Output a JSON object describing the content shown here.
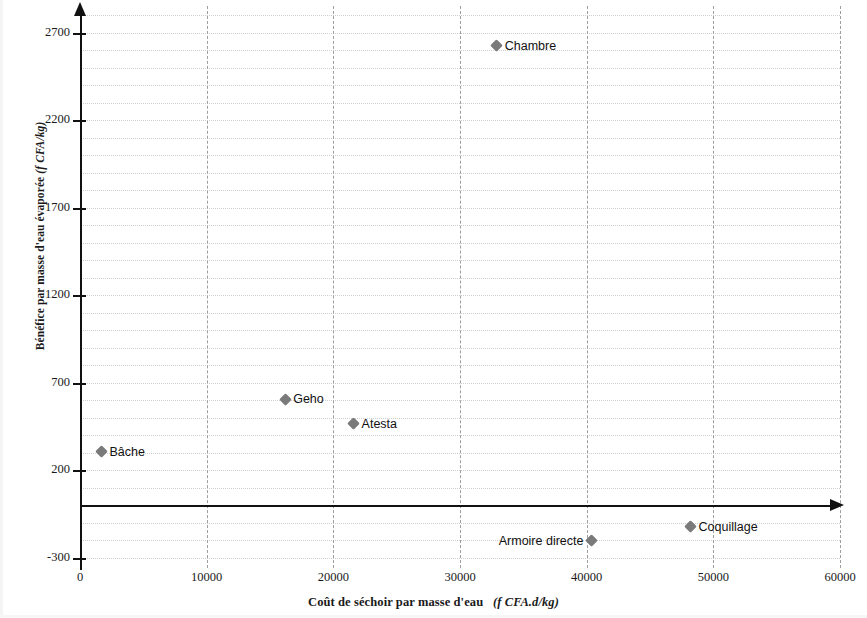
{
  "chart_data": {
    "type": "scatter",
    "title": "",
    "xlabel": "Coût de séchoir par masse d'eau  (f CFA.d/kg)",
    "xlabel_main": "Coût de séchoir par masse d'eau",
    "xlabel_unit": "(f CFA.d/kg)",
    "ylabel": "Bénéfice par masse d'eau évaporée (f CFA/kg)",
    "ylabel_main": "Bénéfice par masse d'eau évaporée",
    "ylabel_unit": "(f CFA/kg)",
    "xlim": [
      0,
      60000
    ],
    "ylim": [
      -300,
      2950
    ],
    "x_ticks": [
      "0",
      "10000",
      "20000",
      "30000",
      "40000",
      "50000",
      "60000"
    ],
    "x_tick_values": [
      0,
      10000,
      20000,
      30000,
      40000,
      50000,
      60000
    ],
    "y_ticks": [
      "2700",
      "2200",
      "1700",
      "1200",
      "700",
      "200",
      "-300"
    ],
    "y_tick_values": [
      2700,
      2200,
      1700,
      1200,
      700,
      200,
      -300
    ],
    "grid": true,
    "grid_major_style": "dashed",
    "grid_minor_style": "dotted",
    "legend": "none",
    "marker": "diamond",
    "marker_color": "#7a7a7a",
    "axis_color": "#111111",
    "points": [
      {
        "label": "Bâche",
        "x": 1700,
        "y": 305,
        "label_side": "right"
      },
      {
        "label": "Geho",
        "x": 16200,
        "y": 605,
        "label_side": "right"
      },
      {
        "label": "Atesta",
        "x": 21600,
        "y": 465,
        "label_side": "right"
      },
      {
        "label": "Chambre",
        "x": 32900,
        "y": 2625,
        "label_side": "right"
      },
      {
        "label": "Armoire directe",
        "x": 40400,
        "y": -205,
        "label_side": "left"
      },
      {
        "label": "Coquillage",
        "x": 48200,
        "y": -125,
        "label_side": "right"
      }
    ]
  }
}
